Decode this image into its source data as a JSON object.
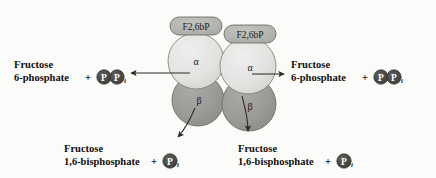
{
  "figure": {
    "name": "pfk2-fbpase2-bifunctional-enzyme-dimer",
    "background_color": "#fbfbf9"
  },
  "colors": {
    "alpha_subunit_fill": "#e2e2e0",
    "beta_subunit_fill": "#9b9b99",
    "ligand_tag_fill": "#b4b4b2",
    "phosphate_circle_fill": "#4a4a48",
    "outline": "#5a5a58",
    "text": "#100f0d",
    "arrow": "#2b2b29"
  },
  "enzyme": {
    "alpha_subunits": [
      {
        "label": "α",
        "cx": 196,
        "cy": 61,
        "r": 28
      },
      {
        "label": "α",
        "cx": 248,
        "cy": 66,
        "r": 28
      }
    ],
    "beta_subunits": [
      {
        "label": "β",
        "cx": 198,
        "cy": 100,
        "r": 26
      },
      {
        "label": "β",
        "cx": 249,
        "cy": 104,
        "r": 27
      }
    ],
    "ligand_tags": [
      {
        "label": "F2,6bP",
        "cx": 196,
        "cy": 26
      },
      {
        "label": "F2,6bP",
        "cx": 250,
        "cy": 34
      }
    ]
  },
  "phosphate": {
    "p_glyph": "P",
    "subscript_i": "i"
  },
  "reactions": {
    "left": {
      "name": "fructose-6-phosphate-left",
      "line1": "Fructose",
      "line2": "6-phosphate",
      "plus": "+",
      "phosphate_count": 2,
      "arrow_direction": "left"
    },
    "right": {
      "name": "fructose-6-phosphate-right",
      "line1": "Fructose",
      "line2": "6-phosphate",
      "plus": "+",
      "phosphate_count": 2,
      "arrow_direction": "right"
    },
    "bottom_left": {
      "name": "fructose-1-6-bisphosphate-left",
      "line1": "Fructose",
      "line2": "1,6-bisphosphate",
      "plus": "+",
      "phosphate_count": 1,
      "arrow_direction": "down-left"
    },
    "bottom_right": {
      "name": "fructose-1-6-bisphosphate-right",
      "line1": "Fructose",
      "line2": "1,6-bisphosphate",
      "plus": "+",
      "phosphate_count": 1,
      "arrow_direction": "down"
    }
  }
}
